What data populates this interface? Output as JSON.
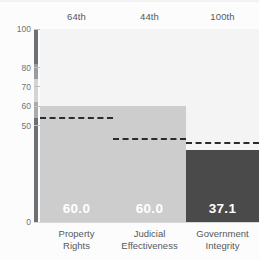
{
  "chart_data": {
    "type": "bar",
    "title": "",
    "subtitle": "",
    "xlabel": "",
    "ylabel": "",
    "ylim": [
      0,
      100
    ],
    "grid": false,
    "legend_position": "none",
    "categories": [
      "Property Rights",
      "Judicial Effectiveness",
      "Government Integrity"
    ],
    "category_lines": [
      [
        "Property",
        "Rights"
      ],
      [
        "Judicial",
        "Effectiveness"
      ],
      [
        "Government",
        "Integrity"
      ]
    ],
    "values": [
      60.0,
      60.0,
      37.1
    ],
    "value_labels": [
      "60.0",
      "60.0",
      "37.1"
    ],
    "bar_colors": [
      "#cdcdcd",
      "#cdcdcd",
      "#4a4a4a"
    ],
    "annotations_top": [
      "64th",
      "44th",
      "100th"
    ],
    "reference_lines": {
      "label": "",
      "values": [
        53.4,
        42.5,
        40.4
      ],
      "style": "dashed",
      "color": "#2b2b2b"
    },
    "track_color": "#f4f4f4",
    "background_color": "#fcfcfc",
    "y_ticks": [
      {
        "value": 100,
        "label": "100"
      },
      {
        "value": 80,
        "label": "80"
      },
      {
        "value": 70,
        "label": "70"
      },
      {
        "value": 60,
        "label": "60"
      },
      {
        "value": 50,
        "label": "50"
      },
      {
        "value": 0,
        "label": "0"
      }
    ],
    "scale_bar_segments": [
      {
        "from": 82,
        "to": 100,
        "color": "#6d7073"
      },
      {
        "from": 74,
        "to": 82,
        "color": "#9a9d9f"
      },
      {
        "from": 62,
        "to": 74,
        "color": "#d2d4d5"
      },
      {
        "from": 54,
        "to": 62,
        "color": "#a9acae"
      },
      {
        "from": 0,
        "to": 54,
        "color": "#6d7073"
      }
    ]
  }
}
